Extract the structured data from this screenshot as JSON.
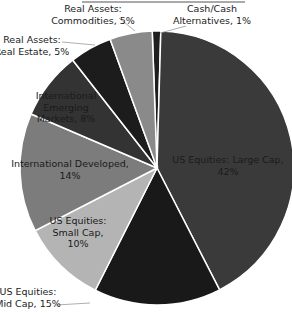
{
  "chart_data": {
    "type": "pie",
    "title": "",
    "start_angle_deg": -2,
    "direction": "clockwise",
    "slices": [
      {
        "label": "Cash/Cash Alternatives",
        "value": 1,
        "color": "#1e1e1e",
        "label_lines": [
          "Cash/Cash",
          "Alternatives, 1%"
        ],
        "label_pos": "outside",
        "lx": 212,
        "ly": 12,
        "leader": [
          [
            186,
            26
          ],
          [
            160,
            33
          ]
        ]
      },
      {
        "label": "US Equities: Large Cap",
        "value": 42,
        "color": "#3a3a3a",
        "label_lines": [
          "US Equities: Large Cap,",
          "42%"
        ],
        "label_pos": "inside",
        "lx": 228,
        "ly": 163
      },
      {
        "label": "US Equities: Mid Cap",
        "value": 15,
        "color": "#191919",
        "label_lines": [
          "US Equities:",
          "Mid Cap, 15%"
        ],
        "label_pos": "outside",
        "lx": 28,
        "ly": 295,
        "leader": [
          [
            56,
            305
          ],
          [
            90,
            303
          ]
        ]
      },
      {
        "label": "US Equities: Small Cap",
        "value": 10,
        "color": "#b4b4b4",
        "label_lines": [
          "US Equities:",
          "Small Cap,",
          "10%"
        ],
        "label_pos": "inside",
        "lx": 78,
        "ly": 224
      },
      {
        "label": "International Developed",
        "value": 14,
        "color": "#7c7c7c",
        "label_lines": [
          "International Developed,",
          "14%"
        ],
        "label_pos": "inside",
        "lx": 70,
        "ly": 167
      },
      {
        "label": "International Emerging Markets",
        "value": 8,
        "color": "#333333",
        "label_lines": [
          "International",
          "Emerging",
          "Markets, 8%"
        ],
        "label_pos": "inside",
        "lx": 66,
        "ly": 99
      },
      {
        "label": "Real Assets: Real Estate",
        "value": 5,
        "color": "#1c1c1c",
        "label_lines": [
          "Real Assets:",
          "Real Estate, 5%"
        ],
        "label_pos": "outside",
        "lx": 32,
        "ly": 43,
        "leader": [
          [
            62,
            42
          ],
          [
            95,
            45
          ]
        ]
      },
      {
        "label": "Real Assets: Commodities",
        "value": 5,
        "color": "#8a8a8a",
        "label_lines": [
          "Real Assets:",
          "Commodities, 5%"
        ],
        "label_pos": "outside",
        "lx": 93,
        "ly": 12,
        "leader": [
          [
            119,
            18
          ],
          [
            135,
            31
          ]
        ]
      }
    ],
    "legend": null,
    "geometry": {
      "cx": 157,
      "cy": 168,
      "r": 137
    }
  },
  "frame": {
    "top_rule": {
      "x1": 82,
      "x2": 245,
      "y": 2
    }
  }
}
